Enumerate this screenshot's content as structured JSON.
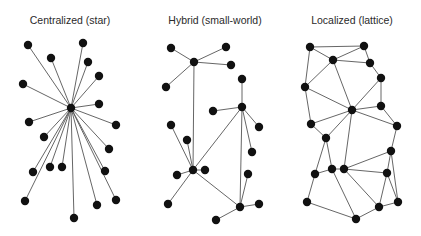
{
  "colors": {
    "background": "#ffffff",
    "edge": "#555555",
    "node": "#111111",
    "title": "#2a2a2a"
  },
  "node_radius": 4.2,
  "panels": [
    {
      "id": "star",
      "title": "Centralized (star)",
      "title_x": 70,
      "title_y": 24,
      "nodes": [
        [
          71,
          108
        ],
        [
          28,
          45
        ],
        [
          83,
          43
        ],
        [
          51,
          58
        ],
        [
          88,
          62
        ],
        [
          99,
          76
        ],
        [
          23,
          84
        ],
        [
          99,
          104
        ],
        [
          29,
          122
        ],
        [
          44,
          137
        ],
        [
          116,
          125
        ],
        [
          109,
          149
        ],
        [
          33,
          172
        ],
        [
          50,
          167
        ],
        [
          62,
          167
        ],
        [
          105,
          171
        ],
        [
          25,
          201
        ],
        [
          97,
          205
        ],
        [
          116,
          200
        ],
        [
          74,
          218
        ]
      ],
      "edges": [
        [
          0,
          1
        ],
        [
          0,
          2
        ],
        [
          0,
          3
        ],
        [
          0,
          4
        ],
        [
          0,
          5
        ],
        [
          0,
          6
        ],
        [
          0,
          7
        ],
        [
          0,
          8
        ],
        [
          0,
          9
        ],
        [
          0,
          10
        ],
        [
          0,
          11
        ],
        [
          0,
          12
        ],
        [
          0,
          13
        ],
        [
          0,
          14
        ],
        [
          0,
          15
        ],
        [
          0,
          16
        ],
        [
          0,
          17
        ],
        [
          0,
          18
        ],
        [
          0,
          19
        ]
      ]
    },
    {
      "id": "hybrid",
      "title": "Hybrid (small-world)",
      "title_x": 215,
      "title_y": 24,
      "nodes": [
        [
          194,
          62
        ],
        [
          171,
          48
        ],
        [
          226,
          47
        ],
        [
          231,
          65
        ],
        [
          166,
          87
        ],
        [
          242,
          107
        ],
        [
          242,
          79
        ],
        [
          213,
          111
        ],
        [
          259,
          127
        ],
        [
          252,
          152
        ],
        [
          193,
          170
        ],
        [
          171,
          125
        ],
        [
          187,
          140
        ],
        [
          177,
          175
        ],
        [
          205,
          170
        ],
        [
          168,
          204
        ],
        [
          240,
          207
        ],
        [
          248,
          174
        ],
        [
          259,
          204
        ],
        [
          216,
          220
        ]
      ],
      "edges": [
        [
          0,
          1
        ],
        [
          0,
          2
        ],
        [
          0,
          3
        ],
        [
          0,
          4
        ],
        [
          0,
          10
        ],
        [
          5,
          6
        ],
        [
          5,
          7
        ],
        [
          5,
          8
        ],
        [
          5,
          9
        ],
        [
          5,
          10
        ],
        [
          5,
          16
        ],
        [
          10,
          11
        ],
        [
          10,
          12
        ],
        [
          10,
          13
        ],
        [
          10,
          14
        ],
        [
          10,
          15
        ],
        [
          10,
          16
        ],
        [
          16,
          17
        ],
        [
          16,
          18
        ],
        [
          16,
          19
        ]
      ]
    },
    {
      "id": "lattice",
      "title": "Localized (lattice)",
      "title_x": 352,
      "title_y": 24,
      "nodes": [
        [
          310,
          47
        ],
        [
          364,
          46
        ],
        [
          333,
          60
        ],
        [
          370,
          63
        ],
        [
          381,
          78
        ],
        [
          305,
          87
        ],
        [
          352,
          110
        ],
        [
          381,
          106
        ],
        [
          311,
          124
        ],
        [
          397,
          126
        ],
        [
          326,
          138
        ],
        [
          391,
          151
        ],
        [
          315,
          174
        ],
        [
          332,
          169
        ],
        [
          344,
          169
        ],
        [
          387,
          173
        ],
        [
          307,
          202
        ],
        [
          379,
          207
        ],
        [
          398,
          202
        ],
        [
          356,
          219
        ]
      ],
      "edges": [
        [
          0,
          1
        ],
        [
          0,
          2
        ],
        [
          2,
          1
        ],
        [
          1,
          3
        ],
        [
          2,
          3
        ],
        [
          3,
          4
        ],
        [
          0,
          5
        ],
        [
          2,
          5
        ],
        [
          2,
          6
        ],
        [
          4,
          6
        ],
        [
          5,
          6
        ],
        [
          5,
          8
        ],
        [
          6,
          7
        ],
        [
          4,
          7
        ],
        [
          7,
          9
        ],
        [
          6,
          9
        ],
        [
          6,
          8
        ],
        [
          6,
          10
        ],
        [
          8,
          10
        ],
        [
          9,
          11
        ],
        [
          6,
          14
        ],
        [
          10,
          12
        ],
        [
          10,
          13
        ],
        [
          12,
          13
        ],
        [
          13,
          14
        ],
        [
          14,
          11
        ],
        [
          14,
          15
        ],
        [
          11,
          15
        ],
        [
          11,
          18
        ],
        [
          12,
          16
        ],
        [
          16,
          19
        ],
        [
          13,
          19
        ],
        [
          14,
          17
        ],
        [
          15,
          17
        ],
        [
          17,
          18
        ],
        [
          17,
          19
        ],
        [
          15,
          18
        ]
      ]
    }
  ]
}
